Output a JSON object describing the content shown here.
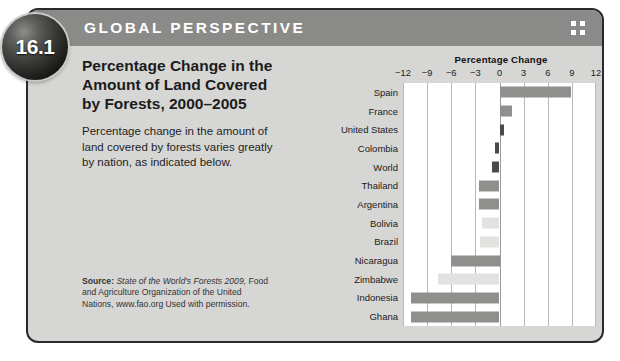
{
  "feature": {
    "number": "16.1",
    "header_label": "GLOBAL PERSPECTIVE",
    "title": "Percentage Change in the Amount of Land Covered by Forests, 2000–2005",
    "lede": "Percentage change in the amount of land covered by forests varies greatly by nation, as indicated below.",
    "source_label": "Source:",
    "source_italic": "State of the World's Forests 2009,",
    "source_rest": "Food and Agriculture Organization of the United Nations, www.fao.org Used with permission."
  },
  "colors": {
    "panel_bg": "#d6d6d4",
    "header_band": "#8a8a88",
    "plot_bg": "#ffffff",
    "gridline": "#b7b7b5",
    "bar_light": "#e2e2e0",
    "bar_mid": "#8f8f8d",
    "bar_dark": "#4a4a48",
    "border": "#2a2a2a"
  },
  "chart_data": {
    "type": "bar",
    "orientation": "horizontal",
    "title": "Percentage Change",
    "xlabel": "Percentage Change",
    "ylabel": "",
    "xlim": [
      -12,
      12
    ],
    "xticks": [
      -12,
      -9,
      -6,
      -3,
      0,
      3,
      6,
      9,
      12
    ],
    "xtick_labels": [
      "−12",
      "−9",
      "−6",
      "−3",
      "0",
      "3",
      "6",
      "9",
      "12"
    ],
    "grid": true,
    "legend": false,
    "categories": [
      "Spain",
      "France",
      "United States",
      "Colombia",
      "World",
      "Thailand",
      "Argentina",
      "Bolivia",
      "Brazil",
      "Nicaragua",
      "Zimbabwe",
      "Indonesia",
      "Ghana"
    ],
    "values": [
      8.9,
      1.5,
      0.5,
      -0.6,
      -0.9,
      -2.5,
      -2.5,
      -2.2,
      -2.4,
      -6.0,
      -7.7,
      -11.0,
      -11.0
    ],
    "bar_shades": [
      "mid",
      "mid",
      "dark",
      "dark",
      "dark",
      "mid",
      "mid",
      "light",
      "light",
      "mid",
      "light",
      "mid",
      "mid"
    ]
  }
}
